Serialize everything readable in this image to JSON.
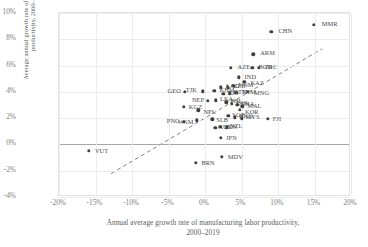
{
  "chart_data": {
    "type": "scatter",
    "title": "",
    "xlabel": "Annual average growth rate of manufacturing labor productivity,\n2000–2019",
    "ylabel": "Average annual growth rate of aggregate labor\nproductivity, 2000–2019",
    "xlim": [
      -20,
      20
    ],
    "ylim": [
      -4,
      10
    ],
    "xticks": [
      "-20%",
      "-15%",
      "-10%",
      "-5%",
      "0%",
      "5%",
      "10%",
      "15%",
      "20%"
    ],
    "xtick_values": [
      -20,
      -15,
      -10,
      -5,
      0,
      5,
      10,
      15,
      20
    ],
    "yticks": [
      "10%",
      "8%",
      "6%",
      "4%",
      "2%",
      "0%",
      "-2%",
      "-4%"
    ],
    "ytick_values": [
      10,
      8,
      6,
      4,
      2,
      0,
      -2,
      -4
    ],
    "grid": true,
    "legend": "none",
    "zero_line_y": 0,
    "trendline": {
      "style": "dashed",
      "color": "#808080",
      "x_start": -12.8,
      "y_start": -2.35,
      "x_end": 16.3,
      "y_end": 7.25
    },
    "point_color": "#3f3f3f",
    "points": [
      {
        "code": "MMR",
        "x": 14.9,
        "y": 9.1,
        "lx": 8,
        "ly": -4
      },
      {
        "code": "CHN",
        "x": 9.1,
        "y": 8.55,
        "lx": 7,
        "ly": -4
      },
      {
        "code": "ARM",
        "x": 6.6,
        "y": 6.85,
        "lx": 7,
        "ly": -4
      },
      {
        "code": "AZE",
        "x": 3.5,
        "y": 5.85,
        "lx": 7,
        "ly": -4
      },
      {
        "code": "BGD",
        "x": 6.5,
        "y": 5.85,
        "lx": 6,
        "ly": -4
      },
      {
        "code": "PRC",
        "x": 7.4,
        "y": 5.85,
        "lx": 6,
        "ly": -4
      },
      {
        "code": "IND",
        "x": 4.6,
        "y": 5.1,
        "lx": 6,
        "ly": -3
      },
      {
        "code": "KAZ",
        "x": 5.4,
        "y": 4.75,
        "lx": 6,
        "ly": -2
      },
      {
        "code": "VNM",
        "x": 3.9,
        "y": 4.45,
        "lx": 5,
        "ly": -4
      },
      {
        "code": "UZB",
        "x": 3.1,
        "y": 4.35,
        "lx": 5,
        "ly": -4
      },
      {
        "code": "LAO",
        "x": 2.2,
        "y": 4.35,
        "lx": 5,
        "ly": -4
      },
      {
        "code": "KHM",
        "x": 1.3,
        "y": 4.1,
        "lx": 5,
        "ly": -4
      },
      {
        "code": "TJK",
        "x": -0.3,
        "y": 4.05,
        "lx": -17,
        "ly": -4
      },
      {
        "code": "MNG",
        "x": 5.9,
        "y": 4.0,
        "lx": 6,
        "ly": -2
      },
      {
        "code": "GEO",
        "x": -2.8,
        "y": 4.0,
        "lx": -17,
        "ly": -4
      },
      {
        "code": "TKM",
        "x": 4.3,
        "y": 3.95,
        "lx": 5,
        "ly": -4
      },
      {
        "code": "BTN",
        "x": 3.4,
        "y": 3.9,
        "lx": 4,
        "ly": -4
      },
      {
        "code": "IDN",
        "x": 2.5,
        "y": 3.85,
        "lx": 4,
        "ly": -4
      },
      {
        "code": "LKA",
        "x": 1.5,
        "y": 3.35,
        "lx": 4,
        "ly": -4
      },
      {
        "code": "PHI",
        "x": 2.9,
        "y": 3.2,
        "lx": 4,
        "ly": -4
      },
      {
        "code": "PAK",
        "x": 3.7,
        "y": 3.1,
        "lx": 4,
        "ly": -4
      },
      {
        "code": "THA",
        "x": 4.4,
        "y": 3.0,
        "lx": 4,
        "ly": -4
      },
      {
        "code": "MAL",
        "x": 5.1,
        "y": 2.9,
        "lx": 5,
        "ly": -3
      },
      {
        "code": "NEP",
        "x": 0.4,
        "y": 3.3,
        "lx": -16,
        "ly": -4
      },
      {
        "code": "KGZ",
        "x": -2.9,
        "y": 2.85,
        "lx": 5,
        "ly": -3
      },
      {
        "code": "NPL",
        "x": -0.9,
        "y": 2.6,
        "lx": 5,
        "ly": -1
      },
      {
        "code": "KOR",
        "x": 4.8,
        "y": 2.65,
        "lx": 5,
        "ly": -1
      },
      {
        "code": "SGP",
        "x": 3.2,
        "y": 2.2,
        "lx": 4,
        "ly": -4
      },
      {
        "code": "HKG",
        "x": 4.1,
        "y": 2.05,
        "lx": 4,
        "ly": -4
      },
      {
        "code": "MYS",
        "x": 5.0,
        "y": 2.0,
        "lx": 4,
        "ly": -4
      },
      {
        "code": "FJI",
        "x": 8.6,
        "y": 1.95,
        "lx": 5,
        "ly": -3
      },
      {
        "code": "SLB",
        "x": 1.0,
        "y": 1.9,
        "lx": 4,
        "ly": -2
      },
      {
        "code": "WSM",
        "x": -1.1,
        "y": 1.85,
        "lx": -19,
        "ly": -1
      },
      {
        "code": "PNG",
        "x": -2.9,
        "y": 1.7,
        "lx": -17,
        "ly": -4
      },
      {
        "code": "TON",
        "x": 2.1,
        "y": 1.35,
        "lx": 4,
        "ly": -3
      },
      {
        "code": "AUS",
        "x": 1.4,
        "y": 1.25,
        "lx": 3,
        "ly": -4
      },
      {
        "code": "NZL",
        "x": 3.0,
        "y": 1.3,
        "lx": 3,
        "ly": -4
      },
      {
        "code": "JPN",
        "x": 2.2,
        "y": 0.5,
        "lx": 5,
        "ly": -3
      },
      {
        "code": "VUT",
        "x": -15.9,
        "y": -0.5,
        "lx": 6,
        "ly": -3
      },
      {
        "code": "MDV",
        "x": 2.3,
        "y": -0.95,
        "lx": 6,
        "ly": -3
      },
      {
        "code": "BRN",
        "x": -1.3,
        "y": -1.4,
        "lx": 6,
        "ly": -3
      }
    ]
  }
}
